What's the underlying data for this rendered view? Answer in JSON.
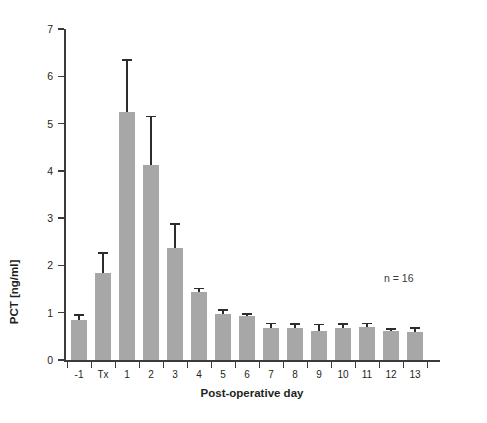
{
  "chart_data": {
    "type": "bar",
    "title": "",
    "subtitle": "",
    "xlabel": "Post-operative day",
    "ylabel": "PCT [ng/ml]",
    "categories": [
      "-1",
      "Tx",
      "1",
      "2",
      "3",
      "4",
      "5",
      "6",
      "7",
      "8",
      "9",
      "10",
      "11",
      "12",
      "13"
    ],
    "values": [
      0.84,
      1.83,
      5.25,
      4.13,
      2.36,
      1.43,
      0.98,
      0.92,
      0.68,
      0.68,
      0.62,
      0.68,
      0.7,
      0.61,
      0.6
    ],
    "error_upper": [
      0.97,
      2.28,
      6.37,
      5.17,
      2.89,
      1.53,
      1.08,
      1.0,
      0.79,
      0.78,
      0.77,
      0.78,
      0.79,
      0.67,
      0.69
    ],
    "errors": [
      0.13,
      0.45,
      1.12,
      1.04,
      0.53,
      0.1,
      0.1,
      0.08,
      0.11,
      0.1,
      0.15,
      0.1,
      0.09,
      0.06,
      0.09
    ],
    "error_type": "upper-only-whisker",
    "ylim": [
      0,
      7
    ],
    "ytick_values": [
      0,
      1,
      2,
      3,
      4,
      5,
      6,
      7
    ],
    "ytick_labels": [
      "0",
      "1",
      "2",
      "3",
      "4",
      "5",
      "6",
      "7"
    ],
    "grid": false,
    "legend": null,
    "legend_position": "none",
    "annotations": [
      {
        "name": "sample-size",
        "text": "n = 16"
      }
    ],
    "bar_color": "#a7a7a7",
    "error_color": "#2c2c2c",
    "axis_color": "#3b3b3b",
    "background_color": "#ffffff"
  }
}
